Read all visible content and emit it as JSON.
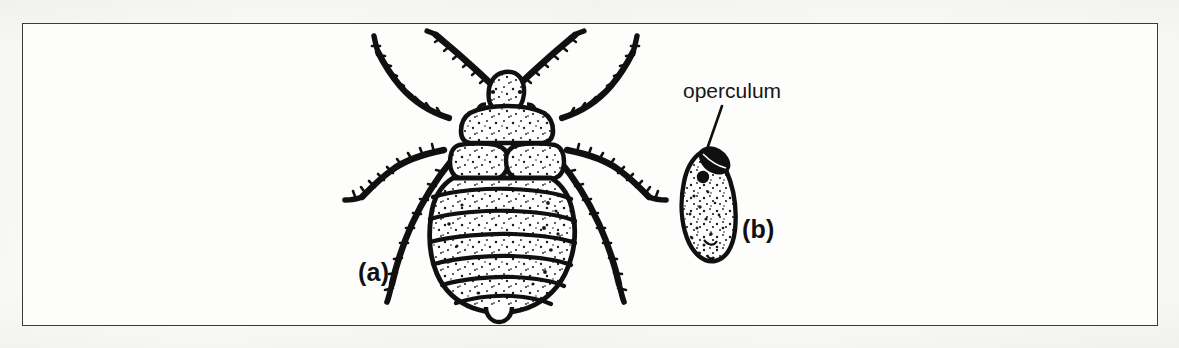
{
  "figure": {
    "kind": "scientific-line-illustration",
    "medium": "scanned black-and-white drawing",
    "background_color": "#fbfbfa",
    "ink_color": "#101010",
    "frame": {
      "border_color": "#3a3a3a",
      "border_width_px": 1.6,
      "x": 22,
      "y": 23,
      "width": 1136,
      "height": 303
    },
    "panels": [
      {
        "id": "a",
        "label": "(a)",
        "subject": "bed bug nymph, dorsal view",
        "label_x": 358,
        "label_y": 258,
        "parts": [
          "antenna-left",
          "antenna-right",
          "head",
          "pronotum",
          "wing-pad-left",
          "wing-pad-right",
          "abdomen-segments",
          "leg-fore-left",
          "leg-fore-right",
          "leg-mid-left",
          "leg-mid-right",
          "leg-hind-left",
          "leg-hind-right"
        ],
        "abdominal_segment_count": 7
      },
      {
        "id": "b",
        "label": "(b)",
        "subject": "egg with operculum",
        "label_x": 742,
        "label_y": 215,
        "annotation": {
          "text": "operculum",
          "text_x": 683,
          "text_y": 79,
          "leader_from": [
            722,
            106
          ],
          "leader_to": [
            706,
            152
          ]
        }
      }
    ]
  },
  "labels": {
    "panel_a": "(a)",
    "panel_b": "(b)",
    "operculum": "operculum"
  }
}
